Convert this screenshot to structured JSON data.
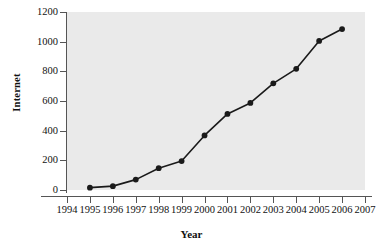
{
  "chart_data": {
    "type": "line",
    "title": "",
    "xlabel": "Year",
    "ylabel": "Internet",
    "grid": false,
    "legend": "none",
    "xlim": [
      1994,
      2007
    ],
    "ylim": [
      0,
      1200
    ],
    "x_ticks": [
      "1994",
      "1995",
      "1996",
      "1997",
      "1998",
      "1999",
      "2000",
      "2001",
      "2002",
      "2003",
      "2004",
      "2005",
      "2006",
      "2007"
    ],
    "y_ticks": [
      "0",
      "200",
      "400",
      "600",
      "800",
      "1000",
      "1200"
    ],
    "marker": "filled-circle",
    "line_color": "#1a1a1a",
    "marker_color": "#1a1a1a",
    "plot_background": "#eaeaea",
    "figure_background": "#ffffff",
    "x": [
      1995,
      1996,
      1997,
      1998,
      1999,
      2000,
      2001,
      2002,
      2003,
      2004,
      2005,
      2006
    ],
    "values": [
      16,
      26,
      70,
      147,
      195,
      368,
      513,
      587,
      719,
      817,
      1005,
      1085
    ],
    "series": [
      {
        "name": "Internet",
        "values": [
          16,
          26,
          70,
          147,
          195,
          368,
          513,
          587,
          719,
          817,
          1005,
          1085
        ]
      }
    ]
  }
}
